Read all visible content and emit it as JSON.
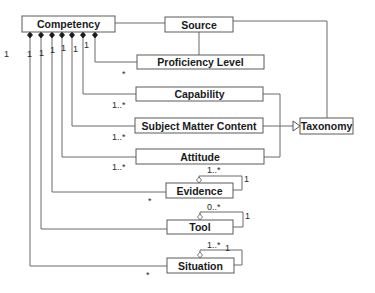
{
  "diagram": {
    "type": "UML class diagram",
    "classes": {
      "competency": "Competency",
      "source": "Source",
      "proficiency_level": "Proficiency Level",
      "capability": "Capability",
      "subject_matter_content": "Subject Matter Content",
      "taxonomy": "Taxonomy",
      "attitude": "Attitude",
      "evidence": "Evidence",
      "tool": "Tool",
      "situation": "Situation"
    },
    "multiplicities": {
      "competency_end": [
        "1",
        "1",
        "1",
        "1",
        "1",
        "1",
        "1"
      ],
      "proficiency_level": "*",
      "capability": "1..*",
      "subject_matter_content": "1..*",
      "attitude": "1..*",
      "evidence": "*",
      "situation": "*",
      "evidence_self_a": "1..*",
      "evidence_self_b": "1",
      "tool_self_a": "0..*",
      "tool_self_b": "1",
      "situation_self_a": "1..*",
      "situation_self_b": "1"
    },
    "relationships": [
      {
        "from": "Competency",
        "to": "Source",
        "kind": "association"
      },
      {
        "from": "Source",
        "to": "Proficiency Level",
        "kind": "association"
      },
      {
        "from": "Source",
        "to": "Taxonomy",
        "kind": "association"
      },
      {
        "from": "Competency",
        "to": "Proficiency Level",
        "kind": "composition",
        "mult": "1 / *"
      },
      {
        "from": "Competency",
        "to": "Capability",
        "kind": "composition",
        "mult": "1 / 1..*"
      },
      {
        "from": "Competency",
        "to": "Subject Matter Content",
        "kind": "composition",
        "mult": "1 / 1..*"
      },
      {
        "from": "Competency",
        "to": "Attitude",
        "kind": "composition",
        "mult": "1 / 1..*"
      },
      {
        "from": "Competency",
        "to": "Evidence",
        "kind": "composition",
        "mult": "1 / *"
      },
      {
        "from": "Competency",
        "to": "Tool",
        "kind": "composition",
        "mult": "1"
      },
      {
        "from": "Competency",
        "to": "Situation",
        "kind": "composition",
        "mult": "1 / *"
      },
      {
        "from": "Capability",
        "to": "Taxonomy",
        "kind": "generalization"
      },
      {
        "from": "Subject Matter Content",
        "to": "Taxonomy",
        "kind": "generalization"
      },
      {
        "from": "Attitude",
        "to": "Taxonomy",
        "kind": "generalization"
      },
      {
        "from": "Evidence",
        "to": "Evidence",
        "kind": "aggregation",
        "mult": "1..* / 1"
      },
      {
        "from": "Tool",
        "to": "Tool",
        "kind": "aggregation",
        "mult": "0..* / 1"
      },
      {
        "from": "Situation",
        "to": "Situation",
        "kind": "aggregation",
        "mult": "1..* / 1"
      }
    ]
  }
}
